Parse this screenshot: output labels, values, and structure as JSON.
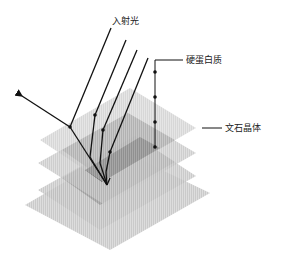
{
  "labels": {
    "incident_light": "入射光",
    "protein": "硬蛋白质",
    "aragonite": "文石晶体"
  },
  "colors": {
    "layer_light": "#c8c8c8",
    "layer_mid": "#9a9a9a",
    "layer_dark": "#555555",
    "line": "#111111"
  }
}
